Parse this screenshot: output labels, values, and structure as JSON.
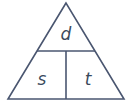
{
  "diagram": {
    "type": "formula-triangle",
    "top_label": "d",
    "bottom_left_label": "s",
    "bottom_right_label": "t",
    "line_color": "#4a5670"
  }
}
